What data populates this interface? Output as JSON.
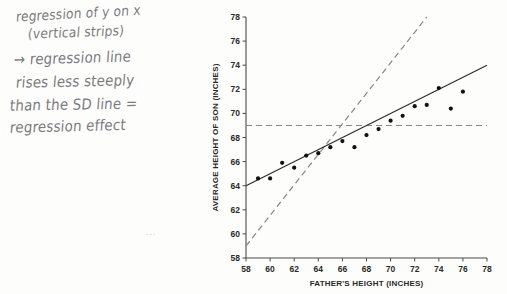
{
  "annotation": {
    "lines": [
      "regression of y on x",
      "(vertical strips)",
      "→ regression line",
      "rises less steeply",
      "than the SD line =",
      "regression effect"
    ],
    "smudge_mark": "...",
    "ink_color": "#6a6a70"
  },
  "chart_data": {
    "type": "scatter",
    "title": "",
    "xlabel": "FATHER'S HEIGHT (INCHES)",
    "ylabel": "AVERAGE HEIGHT OF SON (INCHES)",
    "xlim": [
      58,
      78
    ],
    "ylim": [
      58,
      78
    ],
    "xticks": [
      58,
      60,
      62,
      64,
      66,
      68,
      70,
      72,
      74,
      76,
      78
    ],
    "yticks": [
      58,
      60,
      62,
      64,
      66,
      68,
      70,
      72,
      74,
      76,
      78
    ],
    "grid": false,
    "legend": "none",
    "points": [
      {
        "x": 59.0,
        "y": 64.6
      },
      {
        "x": 60.0,
        "y": 64.6
      },
      {
        "x": 61.0,
        "y": 65.9
      },
      {
        "x": 62.0,
        "y": 65.5
      },
      {
        "x": 63.0,
        "y": 66.5
      },
      {
        "x": 64.0,
        "y": 66.7
      },
      {
        "x": 65.0,
        "y": 67.2
      },
      {
        "x": 66.0,
        "y": 67.7
      },
      {
        "x": 67.0,
        "y": 67.2
      },
      {
        "x": 68.0,
        "y": 68.2
      },
      {
        "x": 69.0,
        "y": 68.7
      },
      {
        "x": 70.0,
        "y": 69.4
      },
      {
        "x": 71.0,
        "y": 69.8
      },
      {
        "x": 72.0,
        "y": 70.6
      },
      {
        "x": 73.0,
        "y": 70.7
      },
      {
        "x": 74.0,
        "y": 72.1
      },
      {
        "x": 75.0,
        "y": 70.4
      },
      {
        "x": 76.0,
        "y": 71.8
      }
    ],
    "series": [
      {
        "name": "regression-line",
        "style": "solid",
        "from": {
          "x": 58,
          "y": 64.0
        },
        "to": {
          "x": 78,
          "y": 74.0
        },
        "slope": 0.5,
        "color": "#2b2b2b"
      },
      {
        "name": "sd-line",
        "style": "dashed",
        "from": {
          "x": 58,
          "y": 59.0
        },
        "to": {
          "x": 73,
          "y": 78.0
        },
        "slope": 1.2667,
        "color": "#8a8a8a"
      },
      {
        "name": "average-son-height-line",
        "style": "dashed-horizontal",
        "y": 69.0,
        "from_x": 58,
        "to_x": 78,
        "color": "#8a8a8a"
      }
    ],
    "point_of_averages": {
      "x": 68,
      "y": 69
    }
  }
}
